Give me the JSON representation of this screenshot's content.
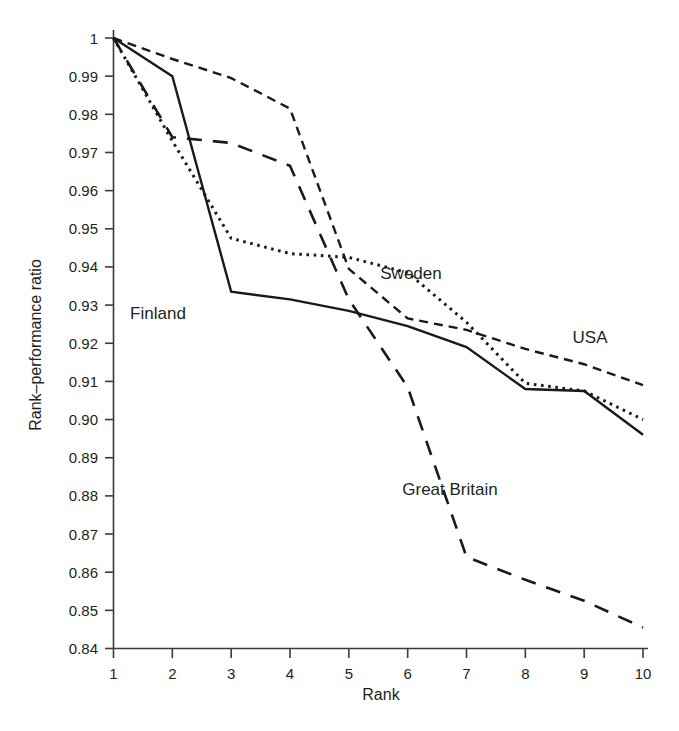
{
  "chart_data": {
    "type": "line",
    "title": "",
    "xlabel": "Rank",
    "ylabel": "Rank–performance ratio",
    "x": [
      1,
      2,
      3,
      4,
      5,
      6,
      7,
      8,
      9,
      10
    ],
    "xtick_labels": [
      "1",
      "2",
      "3",
      "4",
      "5",
      "6",
      "7",
      "8",
      "9",
      "10"
    ],
    "xlim": [
      1,
      10
    ],
    "ylim": [
      0.84,
      1.0
    ],
    "ytick_labels": [
      "1",
      "0.99",
      "0.98",
      "0.97",
      "0.96",
      "0.95",
      "0.94",
      "0.93",
      "0.92",
      "0.91",
      "0.90",
      "0.89",
      "0.88",
      "0.87",
      "0.86",
      "0.85",
      "0.84"
    ],
    "ytick_values": [
      1.0,
      0.99,
      0.98,
      0.97,
      0.96,
      0.95,
      0.94,
      0.93,
      0.92,
      0.91,
      0.9,
      0.89,
      0.88,
      0.87,
      0.86,
      0.85,
      0.84
    ],
    "grid": false,
    "legend_position": "inline-annotations",
    "series": [
      {
        "name": "USA",
        "style": "short-dashed",
        "dasharray": "9,6",
        "width": 2.4,
        "values": [
          1.0,
          0.9945,
          0.9895,
          0.9815,
          0.9395,
          0.9265,
          0.9235,
          0.9185,
          0.9145,
          0.909
        ],
        "label": "USA",
        "label_x": 590,
        "label_y": 343
      },
      {
        "name": "Finland",
        "style": "solid",
        "dasharray": "",
        "width": 2.4,
        "values": [
          1.0,
          0.99,
          0.9335,
          0.9315,
          0.9285,
          0.9245,
          0.919,
          0.908,
          0.9075,
          0.896
        ],
        "label": "Finland",
        "label_x": 158,
        "label_y": 319
      },
      {
        "name": "Sweden",
        "style": "dotted",
        "dasharray": "2.6,4.6",
        "width": 3.0,
        "values": [
          1.0,
          0.973,
          0.9475,
          0.9435,
          0.9425,
          0.9385,
          0.9255,
          0.9095,
          0.9075,
          0.9
        ],
        "label": "Sweden",
        "label_x": 411,
        "label_y": 279
      },
      {
        "name": "Great Britain",
        "style": "long-dashed",
        "dasharray": "15,11",
        "width": 2.6,
        "values": [
          1.0,
          0.974,
          0.9725,
          0.9665,
          0.9315,
          0.9085,
          0.864,
          0.858,
          0.8525,
          0.8455
        ],
        "label": "Great Britain",
        "label_x": 450,
        "label_y": 495
      }
    ]
  },
  "axes": {
    "x_title": "Rank",
    "y_title": "Rank–performance ratio"
  },
  "colors": {
    "ink": "#231f20",
    "axis": "#3b3b3b",
    "line": "#1a1a1a",
    "background": "#ffffff"
  }
}
